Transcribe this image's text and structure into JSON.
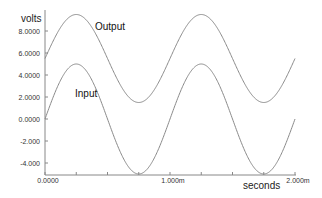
{
  "chart_data": {
    "type": "line",
    "title": "",
    "xlabel": "seconds",
    "ylabel": "volts",
    "xlim": [
      0,
      0.002
    ],
    "ylim": [
      -5,
      10
    ],
    "grid": false,
    "legend_position": "inline",
    "x_ticks": [
      {
        "value": 0,
        "label": "0.0000"
      },
      {
        "value": 0.001,
        "label": "1.000m"
      },
      {
        "value": 0.002,
        "label": "2.000m"
      }
    ],
    "y_ticks": [
      {
        "value": 8,
        "label": "8.0000"
      },
      {
        "value": 6,
        "label": "6.0000"
      },
      {
        "value": 4,
        "label": "4.0000"
      },
      {
        "value": 2,
        "label": "2.0000"
      },
      {
        "value": 0,
        "label": "0.0000"
      },
      {
        "value": -2,
        "label": "-2.000"
      },
      {
        "value": -4,
        "label": "-4.000"
      }
    ],
    "series": [
      {
        "name": "Output",
        "description": "sine wave, offset 5.5 V, amplitude 4 V, period 1 ms",
        "offset": 5.5,
        "amplitude": 4.0,
        "period": 0.001,
        "x": [
          0,
          0.00025,
          0.0005,
          0.00075,
          0.001,
          0.00125,
          0.0015,
          0.00175,
          0.002
        ],
        "values": [
          5.5,
          9.5,
          5.5,
          1.5,
          5.5,
          9.5,
          5.5,
          1.5,
          5.5
        ]
      },
      {
        "name": "Input",
        "description": "sine wave, offset 0 V, amplitude 5 V, period 1 ms",
        "offset": 0,
        "amplitude": 5.0,
        "period": 0.001,
        "x": [
          0,
          0.00025,
          0.0005,
          0.00075,
          0.001,
          0.00125,
          0.0015,
          0.00175,
          0.002
        ],
        "values": [
          0,
          5,
          0,
          -5,
          0,
          5,
          0,
          -5,
          0
        ]
      }
    ]
  },
  "labels": {
    "ylabel": "volts",
    "xlabel": "seconds",
    "output": "Output",
    "input": "Input"
  },
  "colors": {
    "curve": "#8a8a8a",
    "axis": "#777777"
  }
}
